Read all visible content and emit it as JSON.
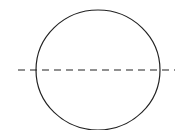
{
  "diagram": {
    "shapes": [
      {
        "type": "circle",
        "role": "outline"
      },
      {
        "type": "dashed-line",
        "role": "horizontal-diameter"
      }
    ],
    "colors": {
      "stroke": "#222222",
      "background": "#ffffff"
    }
  }
}
